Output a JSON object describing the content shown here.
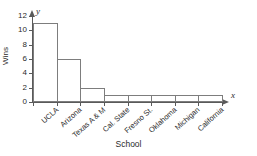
{
  "chart_data": {
    "type": "bar",
    "title": "",
    "xlabel": "School",
    "ylabel": "Wins",
    "categories": [
      "UCLA",
      "Arizona",
      "Texas A & M",
      "Cal. State",
      "Fresno St.",
      "Oklahoma",
      "Michigan",
      "California"
    ],
    "values": [
      11,
      6,
      2,
      1,
      1,
      1,
      1,
      1
    ],
    "ylim": [
      0,
      12
    ],
    "yticks": [
      0,
      2,
      4,
      6,
      8,
      10,
      12
    ],
    "ytick_labels": [
      "0",
      "2",
      "4",
      "6",
      "8",
      "10",
      "12"
    ],
    "grid": false,
    "legend": null,
    "axis_variables": {
      "x": "x",
      "y": "y"
    },
    "colors": {
      "bar_fill": "#ffffff",
      "bar_stroke": "#7d7d7d",
      "axis": "#5a5a5a",
      "text": "#2b2b2b",
      "background": "#ffffff"
    }
  }
}
